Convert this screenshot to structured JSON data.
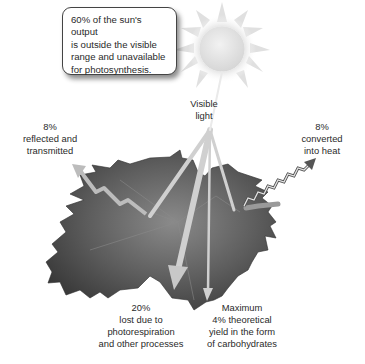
{
  "callout": {
    "lines": [
      "60% of the sun's output",
      "is outside the visible",
      "range and unavailable",
      "for photosynthesis."
    ]
  },
  "labels": {
    "visible_light": [
      "Visible",
      "light"
    ],
    "reflected": [
      "8%",
      "reflected and",
      "transmitted"
    ],
    "heat": [
      "8%",
      "converted",
      "into heat"
    ],
    "photorespiration": [
      "20%",
      "lost due to",
      "photorespiration",
      "and other processes"
    ],
    "carbohydrates": [
      "Maximum",
      "4% theoretical",
      "yield in the form",
      "of carbohydrates"
    ]
  },
  "icons": {
    "sun": "sun-icon",
    "leaf": "maple-leaf-icon"
  },
  "colors": {
    "leaf_dark": "#3c3c3c",
    "leaf_mid": "#6e6e6e",
    "ray": "#d2d2d2",
    "sun_core": "#e8e8e8",
    "sun_glow": "#d8d8d8"
  }
}
